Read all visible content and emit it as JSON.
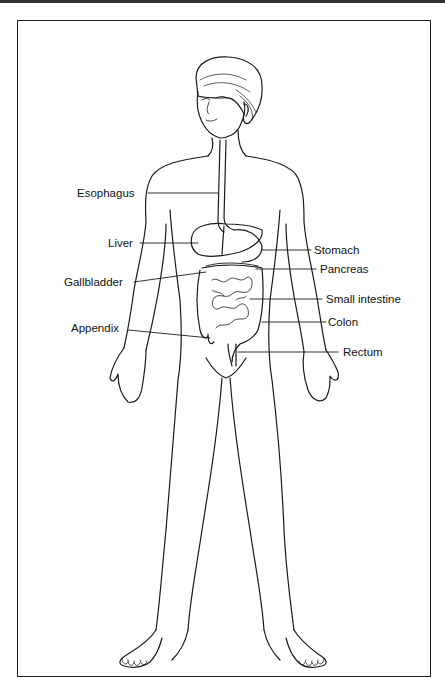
{
  "diagram": {
    "labels_left": [
      {
        "id": "esophagus",
        "text": "Esophagus"
      },
      {
        "id": "liver",
        "text": "Liver"
      },
      {
        "id": "gallbladder",
        "text": "Gallbladder"
      },
      {
        "id": "appendix",
        "text": "Appendix"
      }
    ],
    "labels_right": [
      {
        "id": "stomach",
        "text": "Stomach"
      },
      {
        "id": "pancreas",
        "text": "Pancreas"
      },
      {
        "id": "small-intestine",
        "text": "Small intestine"
      },
      {
        "id": "colon",
        "text": "Colon"
      },
      {
        "id": "rectum",
        "text": "Rectum"
      }
    ],
    "colors": {
      "line": "#1a1a1a",
      "background": "#ffffff"
    }
  }
}
